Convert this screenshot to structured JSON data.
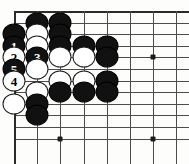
{
  "diagram": {
    "kind": "go-board-diagram",
    "board": {
      "origin_x": 14,
      "origin_y": 11,
      "col_spacing": 23.2,
      "row_spacing": 11.6,
      "cols": 8,
      "rows": 12,
      "line_color": "#4c4c4c",
      "edge_color": "#2b2b2b",
      "background": "#fdfdfc"
    },
    "star_points": [
      {
        "col": 6,
        "row": 4
      },
      {
        "col": 2,
        "row": 11
      },
      {
        "col": 6,
        "row": 11
      }
    ],
    "colors": {
      "black_stone": "#111111",
      "white_stone": "#ffffff",
      "black_label_text": "#ffffff",
      "white_label_text": "#000000"
    },
    "stones": [
      {
        "col": 1,
        "row": 1,
        "color": "black",
        "label": ""
      },
      {
        "col": 2,
        "row": 1,
        "color": "black",
        "label": ""
      },
      {
        "col": 0,
        "row": 2,
        "color": "black",
        "label": ""
      },
      {
        "col": 1,
        "row": 2,
        "color": "white",
        "label": ""
      },
      {
        "col": 2,
        "row": 2,
        "color": "black",
        "label": ""
      },
      {
        "col": 0,
        "row": 3,
        "color": "black",
        "label": "1"
      },
      {
        "col": 1,
        "row": 3,
        "color": "white",
        "label": ""
      },
      {
        "col": 2,
        "row": 3,
        "color": "black",
        "label": ""
      },
      {
        "col": 3,
        "row": 3,
        "color": "black",
        "label": ""
      },
      {
        "col": 4,
        "row": 3,
        "color": "black",
        "label": ""
      },
      {
        "col": 0,
        "row": 4,
        "color": "white",
        "label": "2"
      },
      {
        "col": 1,
        "row": 4,
        "color": "black",
        "label": "3"
      },
      {
        "col": 2,
        "row": 4,
        "color": "white",
        "label": ""
      },
      {
        "col": 3,
        "row": 4,
        "color": "white",
        "label": ""
      },
      {
        "col": 4,
        "row": 4,
        "color": "black",
        "label": ""
      },
      {
        "col": 0,
        "row": 5,
        "color": "black",
        "label": "5"
      },
      {
        "col": 1,
        "row": 5,
        "color": "white",
        "label": ""
      },
      {
        "col": 0,
        "row": 6,
        "color": "white",
        "label": "4"
      },
      {
        "col": 2,
        "row": 6,
        "color": "white",
        "label": ""
      },
      {
        "col": 3,
        "row": 6,
        "color": "white",
        "label": ""
      },
      {
        "col": 4,
        "row": 6,
        "color": "black",
        "label": ""
      },
      {
        "col": 1,
        "row": 7,
        "color": "white",
        "label": ""
      },
      {
        "col": 2,
        "row": 7,
        "color": "black",
        "label": ""
      },
      {
        "col": 3,
        "row": 7,
        "color": "black",
        "label": ""
      },
      {
        "col": 4,
        "row": 7,
        "color": "black",
        "label": ""
      },
      {
        "col": 0,
        "row": 8,
        "color": "white",
        "label": ""
      },
      {
        "col": 1,
        "row": 8,
        "color": "black",
        "label": ""
      },
      {
        "col": 1,
        "row": 9,
        "color": "black",
        "label": ""
      }
    ],
    "move_sequence": [
      {
        "number": "1",
        "color": "black"
      },
      {
        "number": "2",
        "color": "white"
      },
      {
        "number": "3",
        "color": "black"
      },
      {
        "number": "4",
        "color": "white"
      },
      {
        "number": "5",
        "color": "black"
      }
    ]
  }
}
